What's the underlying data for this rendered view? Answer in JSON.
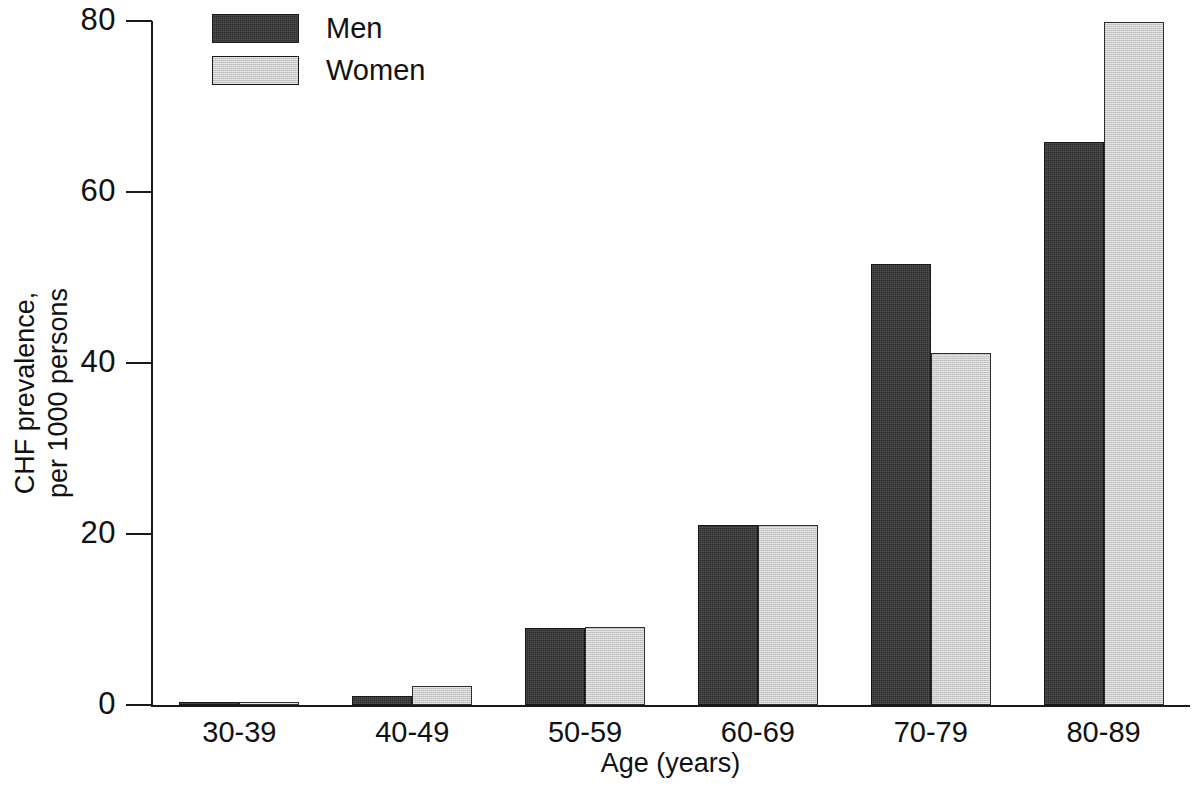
{
  "chart_data": {
    "type": "bar",
    "title": "",
    "xlabel": "Age (years)",
    "ylabel": "CHF prevalence,\nper 1000 persons",
    "categories": [
      "30-39",
      "40-49",
      "50-59",
      "60-69",
      "70-79",
      "80-89"
    ],
    "series": [
      {
        "name": "Men",
        "color": "#2b2b2b",
        "values": [
          0.4,
          1.1,
          9.0,
          21.0,
          51.6,
          65.8
        ]
      },
      {
        "name": "Women",
        "color": "#c9c9c9",
        "values": [
          0.4,
          2.2,
          9.1,
          21.1,
          41.2,
          79.9
        ]
      }
    ],
    "ylim": [
      0,
      80
    ],
    "yticks": [
      0,
      20,
      40,
      60,
      80
    ],
    "ytick_labels": [
      "0",
      "20",
      "40",
      "60",
      "80"
    ],
    "grid": false,
    "legend_position": "top-left",
    "legend": [
      {
        "label": "Men",
        "color": "#2b2b2b"
      },
      {
        "label": "Women",
        "color": "#c9c9c9"
      }
    ]
  }
}
